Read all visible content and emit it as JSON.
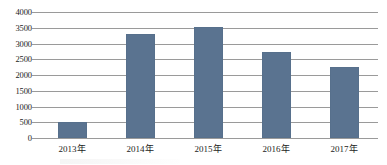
{
  "chart_data": {
    "type": "bar",
    "title": "",
    "xlabel": "",
    "ylabel": "",
    "categories": [
      "2013年",
      "2014年",
      "2015年",
      "2016年",
      "2017年"
    ],
    "values": [
      500,
      3300,
      3520,
      2720,
      2250
    ],
    "ylim": [
      0,
      4000
    ],
    "yticks": [
      4000,
      3500,
      3000,
      2500,
      2000,
      1500,
      1000,
      500,
      0
    ],
    "ytick_labels": [
      "4000",
      "3500",
      "3000",
      "2500",
      "2000",
      "1500",
      "1000",
      "500",
      "0"
    ],
    "grid": true,
    "legend": false,
    "series": [
      {
        "name": "",
        "color": "#5a7390",
        "values": [
          500,
          3300,
          3520,
          2720,
          2250
        ]
      }
    ],
    "bar_color": "#5a7390",
    "gridline_color": "#9a9a9a",
    "background_color": "#ffffff",
    "text_color": "#1c1c1c"
  }
}
